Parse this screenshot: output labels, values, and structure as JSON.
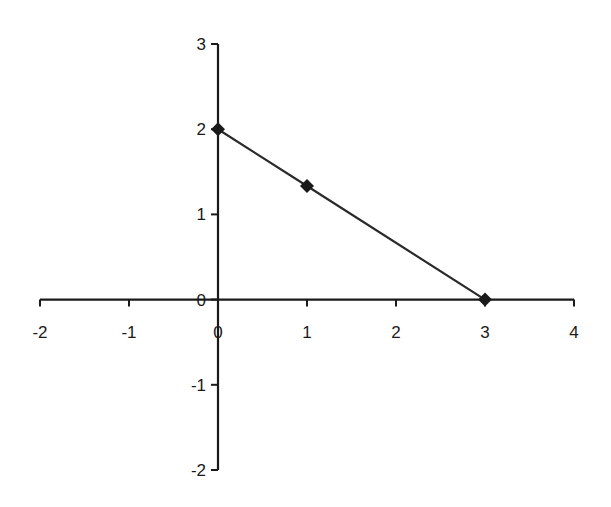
{
  "chart_data": {
    "type": "line",
    "title": "",
    "xlabel": "",
    "ylabel": "",
    "xlim": [
      -2,
      4
    ],
    "ylim": [
      -2,
      3
    ],
    "grid": false,
    "legend": null,
    "x_ticks": [
      "-2",
      "-1",
      "0",
      "1",
      "2",
      "3",
      "4"
    ],
    "y_ticks": [
      "-2",
      "-1",
      "0",
      "1",
      "2",
      "3"
    ],
    "series": [
      {
        "name": "Series 1",
        "marker": "diamond",
        "color": "#1a1a1a",
        "x": [
          0,
          1,
          3
        ],
        "y": [
          2,
          1.333,
          0
        ]
      }
    ]
  },
  "colors": {
    "axis": "#1a1a1a",
    "line": "#2a2a2a",
    "marker": "#1a1a1a",
    "background": "#ffffff"
  }
}
